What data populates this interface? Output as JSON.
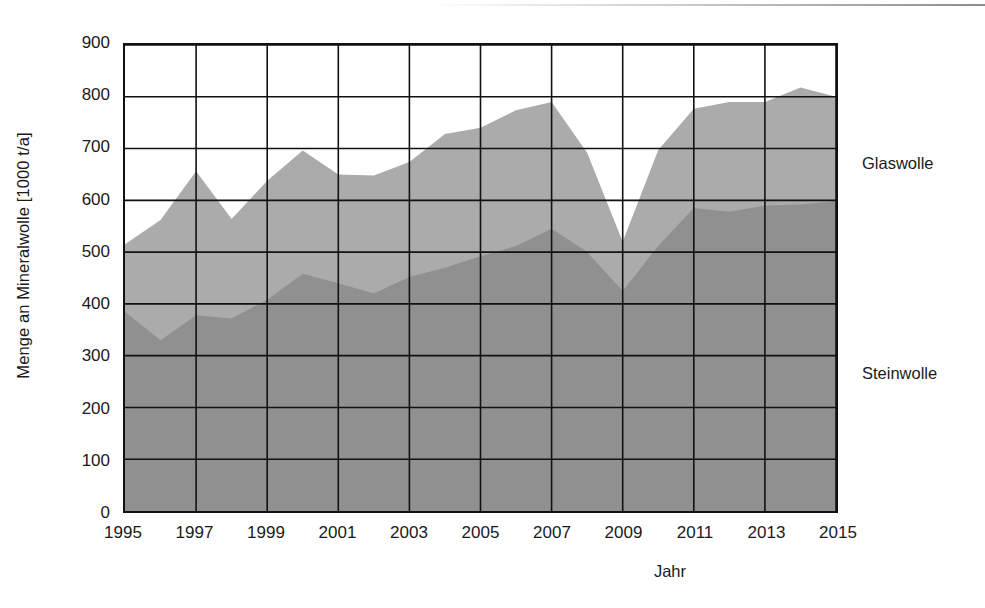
{
  "chart_data": {
    "type": "area",
    "stacked": true,
    "title": "",
    "xlabel": "Jahr",
    "ylabel": "Menge an Mineralwolle [1000 t/a]",
    "xlim": [
      1995,
      2015
    ],
    "ylim": [
      0,
      900
    ],
    "ytick_step": 100,
    "xtick_step": 2,
    "grid": true,
    "legend_position": "right-inline",
    "x": [
      1995,
      1996,
      1997,
      1998,
      1999,
      2000,
      2001,
      2002,
      2003,
      2004,
      2005,
      2006,
      2007,
      2008,
      2009,
      2010,
      2011,
      2012,
      2013,
      2014,
      2015
    ],
    "xticks": [
      "1995",
      "1997",
      "1999",
      "2001",
      "2003",
      "2005",
      "2007",
      "2009",
      "2011",
      "2013",
      "2015"
    ],
    "yticks": [
      "0",
      "100",
      "200",
      "300",
      "400",
      "500",
      "600",
      "700",
      "800",
      "900"
    ],
    "series": [
      {
        "name": "Steinwolle",
        "color": "#909090",
        "values": [
          385,
          330,
          378,
          372,
          408,
          458,
          440,
          420,
          452,
          470,
          492,
          512,
          545,
          500,
          425,
          512,
          585,
          578,
          590,
          592,
          598
        ]
      },
      {
        "name": "Glaswolle",
        "color": "#ababab",
        "values": [
          130,
          232,
          278,
          192,
          230,
          238,
          210,
          228,
          222,
          258,
          248,
          262,
          245,
          192,
          95,
          185,
          192,
          212,
          200,
          226,
          202
        ]
      }
    ],
    "totals": [
      515,
      562,
      656,
      564,
      638,
      696,
      650,
      648,
      674,
      728,
      740,
      774,
      790,
      692,
      520,
      697,
      777,
      790,
      790,
      818,
      800
    ]
  },
  "labels": {
    "y_axis_title": "Menge an Mineralwolle [1000 t/a]",
    "x_axis_title": "Jahr",
    "series_glaswolle": "Glaswolle",
    "series_steinwolle": "Steinwolle"
  }
}
